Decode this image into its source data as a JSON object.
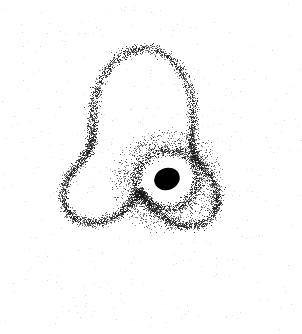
{
  "figure": {
    "width": 302,
    "height": 334,
    "background_color": "#ffffff",
    "title": "",
    "xlabel": "",
    "ylabel": "",
    "axes_visible": false,
    "grid_visible": false,
    "legend_visible": false,
    "ticks_visible": false,
    "frame_visible": false
  },
  "chart_data": {
    "type": "scatter",
    "title": "",
    "subtitle": "",
    "xlabel": "",
    "ylabel": "",
    "xlim": [
      0,
      302
    ],
    "ylim": [
      0,
      334
    ],
    "grid": false,
    "legend": null,
    "annotations": [],
    "marker": {
      "shape": "point",
      "size_px": 1,
      "color": "#222222",
      "opacity": 0.85
    },
    "series": [
      {
        "name": "trefoil-curve-points",
        "description": "Dense point cloud tracing a three-lobed trefoil knot curve with an inner spiral loop",
        "point_count": 5200,
        "color": "#1a1a1a",
        "jitter_sigma_px": 2.6,
        "curve_model": "trefoil",
        "curve_params": {
          "center_x": 141,
          "center_y": 160,
          "radius_outer": 98,
          "radius_inner": 46,
          "lobes": 3,
          "rotation_deg": -88,
          "squash_y": 0.96,
          "t_min": 0,
          "t_max": 6.283185307179586
        },
        "lobe_apexes": [
          {
            "name": "top-lobe-apex",
            "x": 160,
            "y": 32
          },
          {
            "name": "left-lobe-apex",
            "x": 30,
            "y": 215
          },
          {
            "name": "right-lobe-apex",
            "x": 248,
            "y": 205
          }
        ],
        "bounding_box": {
          "x_min": 28,
          "y_min": 30,
          "x_max": 250,
          "y_max": 266
        }
      },
      {
        "name": "inner-ring-points",
        "description": "Tight elliptical ring of points surrounding the central black disc",
        "point_count": 1500,
        "color": "#111111",
        "ring_center_x": 167,
        "ring_center_y": 179,
        "ring_radius_x": 32,
        "ring_radius_y": 29,
        "ring_thickness_px": 9,
        "ring_rotation_deg": -18
      },
      {
        "name": "background-noise-points",
        "description": "Sparse faint scattered noise points across the whole canvas, denser near the figure",
        "point_count": 430,
        "color": "#b9b9c2",
        "opacity": 0.6,
        "size_px": 1
      }
    ],
    "marker_overlay": {
      "name": "central-black-disc",
      "shape": "ellipse",
      "center_x": 167,
      "center_y": 179,
      "radius_x": 13,
      "radius_y": 11,
      "rotation_deg": -22,
      "fill_color": "#000000"
    }
  },
  "accessibility": {
    "alt_text": "Scatter point cloud forming a three-lobed trefoil knot with a solid black dot at its center on a white background"
  }
}
